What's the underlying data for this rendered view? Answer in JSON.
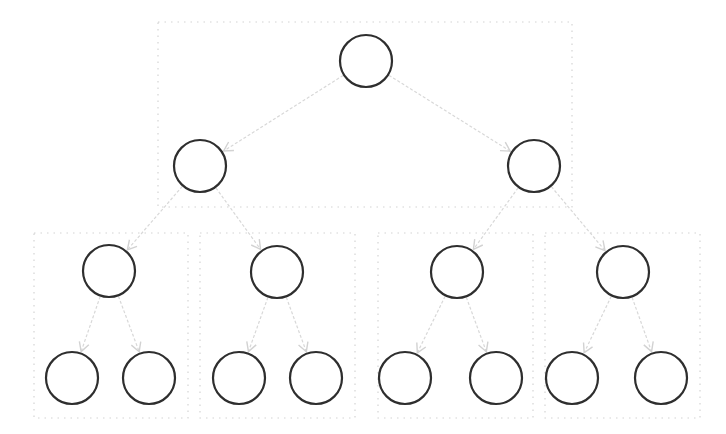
{
  "diagram": {
    "type": "binary-tree",
    "levels": 4,
    "colors": {
      "node_stroke": "#2e2e2e",
      "edge": "#d8d8d8",
      "group_box": "#d4d4d4",
      "background": "#ffffff"
    },
    "groups": [
      {
        "id": "group-root",
        "x": 158,
        "y": 22,
        "w": 414,
        "h": 185
      },
      {
        "id": "group-ll",
        "x": 34,
        "y": 233,
        "w": 154,
        "h": 185
      },
      {
        "id": "group-lr",
        "x": 200,
        "y": 233,
        "w": 155,
        "h": 185
      },
      {
        "id": "group-rl",
        "x": 378,
        "y": 233,
        "w": 155,
        "h": 185
      },
      {
        "id": "group-rr",
        "x": 545,
        "y": 233,
        "w": 155,
        "h": 185
      }
    ],
    "nodes": [
      {
        "id": "n0",
        "label": "",
        "cx": 366,
        "cy": 61,
        "r": 26
      },
      {
        "id": "n1",
        "label": "",
        "cx": 200,
        "cy": 166,
        "r": 26
      },
      {
        "id": "n2",
        "label": "",
        "cx": 534,
        "cy": 166,
        "r": 26
      },
      {
        "id": "n3",
        "label": "",
        "cx": 109,
        "cy": 271,
        "r": 26
      },
      {
        "id": "n4",
        "label": "",
        "cx": 277,
        "cy": 272,
        "r": 26
      },
      {
        "id": "n5",
        "label": "",
        "cx": 457,
        "cy": 272,
        "r": 26
      },
      {
        "id": "n6",
        "label": "",
        "cx": 623,
        "cy": 272,
        "r": 26
      },
      {
        "id": "n7",
        "label": "",
        "cx": 72,
        "cy": 378,
        "r": 26
      },
      {
        "id": "n8",
        "label": "",
        "cx": 149,
        "cy": 378,
        "r": 26
      },
      {
        "id": "n9",
        "label": "",
        "cx": 239,
        "cy": 378,
        "r": 26
      },
      {
        "id": "n10",
        "label": "",
        "cx": 316,
        "cy": 378,
        "r": 26
      },
      {
        "id": "n11",
        "label": "",
        "cx": 405,
        "cy": 378,
        "r": 26
      },
      {
        "id": "n12",
        "label": "",
        "cx": 496,
        "cy": 378,
        "r": 26
      },
      {
        "id": "n13",
        "label": "",
        "cx": 572,
        "cy": 378,
        "r": 26
      },
      {
        "id": "n14",
        "label": "",
        "cx": 661,
        "cy": 378,
        "r": 26
      }
    ],
    "edges": [
      {
        "from": "n0",
        "to": "n1"
      },
      {
        "from": "n0",
        "to": "n2"
      },
      {
        "from": "n1",
        "to": "n3"
      },
      {
        "from": "n1",
        "to": "n4"
      },
      {
        "from": "n2",
        "to": "n5"
      },
      {
        "from": "n2",
        "to": "n6"
      },
      {
        "from": "n3",
        "to": "n7"
      },
      {
        "from": "n3",
        "to": "n8"
      },
      {
        "from": "n4",
        "to": "n9"
      },
      {
        "from": "n4",
        "to": "n10"
      },
      {
        "from": "n5",
        "to": "n11"
      },
      {
        "from": "n5",
        "to": "n12"
      },
      {
        "from": "n6",
        "to": "n13"
      },
      {
        "from": "n6",
        "to": "n14"
      }
    ]
  }
}
